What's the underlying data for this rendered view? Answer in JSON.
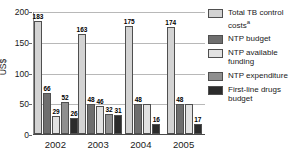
{
  "chart_data": {
    "type": "bar",
    "title": "",
    "xlabel": "",
    "ylabel": "US$",
    "ylim": [
      0,
      200
    ],
    "yticks": [
      "0",
      "50",
      "100",
      "150",
      "200"
    ],
    "grid": true,
    "legend_position": "right",
    "categories": [
      "2002",
      "2003",
      "2004",
      "2005"
    ],
    "series": [
      {
        "name": "Total TB control costs",
        "color": "#d3d3d3",
        "values": [
          183,
          163,
          175,
          174
        ]
      },
      {
        "name": "NTP budget",
        "color": "#6e6e6e",
        "values": [
          66,
          48,
          48,
          48
        ]
      },
      {
        "name": "NTP available funding",
        "color": "#e2e2e2",
        "values": [
          29,
          46,
          48,
          48
        ]
      },
      {
        "name": "NTP expenditure",
        "color": "#8f8f8f",
        "values": [
          52,
          32,
          null,
          null
        ]
      },
      {
        "name": "First-line drugs budget",
        "color": "#2b2b2b",
        "values": [
          26,
          31,
          16,
          17
        ]
      }
    ],
    "groups": [
      {
        "year": "2002",
        "bars": [
          {
            "series": "Total TB control costs",
            "value": 183,
            "label": "183",
            "color_key": "c-total"
          },
          {
            "series": "NTP budget",
            "value": 66,
            "label": "66",
            "color_key": "c-budget"
          },
          {
            "series": "NTP available funding",
            "value": 29,
            "label": "29",
            "color_key": "c-available"
          },
          {
            "series": "NTP expenditure",
            "value": 52,
            "label": "52",
            "color_key": "c-expenditure"
          },
          {
            "series": "First-line drugs budget",
            "value": 26,
            "label": "26",
            "color_key": "c-drugs"
          }
        ]
      },
      {
        "year": "2003",
        "bars": [
          {
            "series": "Total TB control costs",
            "value": 163,
            "label": "163",
            "color_key": "c-total"
          },
          {
            "series": "NTP budget",
            "value": 48,
            "label": "48",
            "color_key": "c-budget"
          },
          {
            "series": "NTP available funding",
            "value": 46,
            "label": "46",
            "color_key": "c-available"
          },
          {
            "series": "NTP expenditure",
            "value": 32,
            "label": "32",
            "color_key": "c-expenditure"
          },
          {
            "series": "First-line drugs budget",
            "value": 31,
            "label": "31",
            "color_key": "c-drugs"
          }
        ]
      },
      {
        "year": "2004",
        "bars": [
          {
            "series": "Total TB control costs",
            "value": 175,
            "label": "175",
            "color_key": "c-total"
          },
          {
            "series": "NTP budget",
            "value": 48,
            "label": "48",
            "color_key": "c-budget"
          },
          {
            "series": "NTP available funding",
            "value": 48,
            "label": "",
            "color_key": "c-available"
          },
          {
            "series": "First-line drugs budget",
            "value": 16,
            "label": "16",
            "color_key": "c-drugs"
          }
        ]
      },
      {
        "year": "2005",
        "bars": [
          {
            "series": "Total TB control costs",
            "value": 174,
            "label": "174",
            "color_key": "c-total"
          },
          {
            "series": "NTP budget",
            "value": 48,
            "label": "48",
            "color_key": "c-budget"
          },
          {
            "series": "NTP available funding",
            "value": 48,
            "label": "",
            "color_key": "c-available"
          },
          {
            "series": "First-line drugs budget",
            "value": 17,
            "label": "17",
            "color_key": "c-drugs"
          }
        ]
      }
    ]
  },
  "legend": {
    "items": [
      {
        "label": "Total TB control costs",
        "superscript": "a",
        "color_key": "c-total"
      },
      {
        "label": "NTP budget",
        "superscript": "",
        "color_key": "c-budget"
      },
      {
        "label": "NTP available funding",
        "superscript": "",
        "color_key": "c-available"
      },
      {
        "label": "NTP expenditure",
        "superscript": "",
        "color_key": "c-expenditure"
      },
      {
        "label": "First-line drugs budget",
        "superscript": "",
        "color_key": "c-drugs"
      }
    ]
  }
}
